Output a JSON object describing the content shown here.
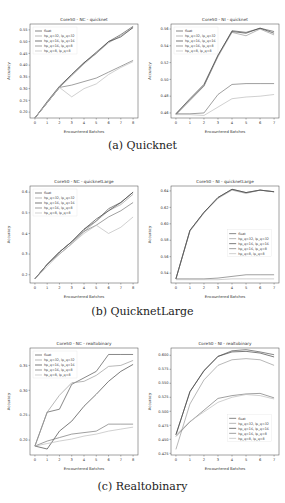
{
  "captions": {
    "a": "(a) Quicknet",
    "b": "(b) QuicknetLarge",
    "c": "(c) Realtobinary"
  },
  "legend_labels": [
    "float",
    "hp_q=32, lp_q=32",
    "hp_q=16, lp_q=16",
    "hp_q=16, lp_q=8",
    "hp_q=8, lp_q=8"
  ],
  "series_colors": [
    "#555555",
    "#9a9a9a",
    "#444444",
    "#777777",
    "#bbbbbb"
  ],
  "chart_data": [
    {
      "id": "nc_quicknet",
      "type": "line",
      "title": "Core50 - NC - quicknet",
      "xlabel": "Encountered Batches",
      "ylabel": "Accuracy",
      "x": [
        0,
        1,
        2,
        3,
        4,
        5,
        6,
        7,
        8
      ],
      "xticks": [
        "0",
        "1",
        "2",
        "3",
        "4",
        "5",
        "6",
        "7",
        "8"
      ],
      "yticks": [
        "0.20",
        "0.25",
        "0.30",
        "0.35",
        "0.40",
        "0.45",
        "0.50",
        "0.55"
      ],
      "ylim": [
        0.175,
        0.575
      ],
      "legend_position": "upper left",
      "series": [
        {
          "name": "float",
          "values": [
            0.175,
            0.24,
            0.305,
            0.36,
            0.41,
            0.45,
            0.5,
            0.53,
            0.565
          ]
        },
        {
          "name": "hp_q=32, lp_q=32",
          "values": [
            0.175,
            0.24,
            0.305,
            0.355,
            0.405,
            0.45,
            0.495,
            0.525,
            0.56
          ]
        },
        {
          "name": "hp_q=16, lp_q=16",
          "values": [
            0.175,
            0.245,
            0.31,
            0.36,
            0.41,
            0.455,
            0.5,
            0.52,
            0.56
          ]
        },
        {
          "name": "hp_q=16, lp_q=8",
          "values": [
            0.175,
            0.24,
            0.305,
            0.315,
            0.33,
            0.345,
            0.37,
            0.395,
            0.42
          ]
        },
        {
          "name": "hp_q=8, lp_q=8",
          "values": [
            0.175,
            0.24,
            0.305,
            0.265,
            0.3,
            0.32,
            0.36,
            0.39,
            0.415
          ]
        }
      ]
    },
    {
      "id": "ni_quicknet",
      "type": "line",
      "title": "Core50 - NI - quicknet",
      "xlabel": "Encountered Batches",
      "ylabel": "Accuracy",
      "x": [
        0,
        1,
        2,
        3,
        4,
        5,
        6,
        7
      ],
      "xticks": [
        "0",
        "1",
        "2",
        "3",
        "4",
        "5",
        "6",
        "7"
      ],
      "yticks": [
        "0.46",
        "0.48",
        "0.50",
        "0.52",
        "0.54",
        "0.56"
      ],
      "ylim": [
        0.454,
        0.566
      ],
      "legend_position": "upper left",
      "series": [
        {
          "name": "float",
          "values": [
            0.458,
            0.475,
            0.492,
            0.528,
            0.558,
            0.556,
            0.561,
            0.557
          ]
        },
        {
          "name": "hp_q=32, lp_q=32",
          "values": [
            0.459,
            0.476,
            0.493,
            0.527,
            0.556,
            0.552,
            0.56,
            0.553
          ]
        },
        {
          "name": "hp_q=16, lp_q=16",
          "values": [
            0.459,
            0.477,
            0.494,
            0.529,
            0.557,
            0.555,
            0.561,
            0.555
          ]
        },
        {
          "name": "hp_q=16, lp_q=8",
          "values": [
            0.459,
            0.459,
            0.46,
            0.482,
            0.494,
            0.495,
            0.495,
            0.495
          ]
        },
        {
          "name": "hp_q=8, lp_q=8",
          "values": [
            0.458,
            0.458,
            0.457,
            0.467,
            0.477,
            0.479,
            0.48,
            0.482
          ]
        }
      ]
    },
    {
      "id": "nc_quicknetlarge",
      "type": "line",
      "title": "Core50 - NC - quicknetLarge",
      "xlabel": "Encountered Batches",
      "ylabel": "Accuracy",
      "x": [
        0,
        1,
        2,
        3,
        4,
        5,
        6,
        7,
        8
      ],
      "xticks": [
        "0",
        "1",
        "2",
        "3",
        "4",
        "5",
        "6",
        "7",
        "8"
      ],
      "yticks": [
        "0.2",
        "0.3",
        "0.4",
        "0.5",
        "0.6"
      ],
      "ylim": [
        0.16,
        0.63
      ],
      "legend_position": "upper left",
      "series": [
        {
          "name": "float",
          "values": [
            0.18,
            0.25,
            0.31,
            0.36,
            0.42,
            0.46,
            0.52,
            0.55,
            0.6
          ]
        },
        {
          "name": "hp_q=32, lp_q=32",
          "values": [
            0.18,
            0.25,
            0.31,
            0.36,
            0.41,
            0.46,
            0.51,
            0.54,
            0.59
          ]
        },
        {
          "name": "hp_q=16, lp_q=16",
          "values": [
            0.18,
            0.25,
            0.31,
            0.36,
            0.42,
            0.47,
            0.51,
            0.55,
            0.6
          ]
        },
        {
          "name": "hp_q=16, lp_q=8",
          "values": [
            0.18,
            0.25,
            0.3,
            0.35,
            0.41,
            0.44,
            0.48,
            0.51,
            0.55
          ]
        },
        {
          "name": "hp_q=8, lp_q=8",
          "values": [
            0.18,
            0.24,
            0.3,
            0.35,
            0.4,
            0.44,
            0.4,
            0.43,
            0.48
          ]
        }
      ]
    },
    {
      "id": "ni_quicknetlarge",
      "type": "line",
      "title": "Core50 - NI - quicknetLarge",
      "xlabel": "Encountered Batches",
      "ylabel": "Accuracy",
      "x": [
        0,
        1,
        2,
        3,
        4,
        5,
        6,
        7
      ],
      "xticks": [
        "0",
        "1",
        "2",
        "3",
        "4",
        "5",
        "6",
        "7"
      ],
      "yticks": [
        "0.54",
        "0.56",
        "0.58",
        "0.60",
        "0.62",
        "0.64"
      ],
      "ylim": [
        0.528,
        0.646
      ],
      "legend_position": "center right",
      "series": [
        {
          "name": "float",
          "values": [
            0.533,
            0.592,
            0.614,
            0.632,
            0.642,
            0.638,
            0.641,
            0.639
          ]
        },
        {
          "name": "hp_q=32, lp_q=32",
          "values": [
            0.533,
            0.591,
            0.613,
            0.631,
            0.641,
            0.637,
            0.641,
            0.639
          ]
        },
        {
          "name": "hp_q=16, lp_q=16",
          "values": [
            0.533,
            0.592,
            0.614,
            0.632,
            0.642,
            0.638,
            0.641,
            0.639
          ]
        },
        {
          "name": "hp_q=16, lp_q=8",
          "values": [
            0.533,
            0.533,
            0.533,
            0.534,
            0.536,
            0.538,
            0.538,
            0.538
          ]
        },
        {
          "name": "hp_q=8, lp_q=8",
          "values": [
            0.532,
            0.532,
            0.532,
            0.532,
            0.533,
            0.533,
            0.533,
            0.533
          ]
        }
      ]
    },
    {
      "id": "nc_realtobinary",
      "type": "line",
      "title": "Core50 - NC - realtobinary",
      "xlabel": "Encountered Batches",
      "ylabel": "Accuracy",
      "x": [
        0,
        1,
        2,
        3,
        4,
        5,
        6,
        7,
        8
      ],
      "xticks": [
        "0",
        "1",
        "2",
        "3",
        "4",
        "5",
        "6",
        "7",
        "8"
      ],
      "yticks": [
        "0.20",
        "0.25",
        "0.30",
        "0.35"
      ],
      "ylim": [
        0.17,
        0.385
      ],
      "legend_position": "upper left",
      "series": [
        {
          "name": "float",
          "values": [
            0.188,
            0.256,
            0.262,
            0.312,
            0.325,
            0.338,
            0.372,
            0.372,
            0.372
          ]
        },
        {
          "name": "hp_q=32, lp_q=32",
          "values": [
            0.188,
            0.256,
            0.29,
            0.315,
            0.318,
            0.33,
            0.348,
            0.35,
            0.36
          ]
        },
        {
          "name": "hp_q=16, lp_q=16",
          "values": [
            0.188,
            0.182,
            0.218,
            0.238,
            0.268,
            0.292,
            0.318,
            0.338,
            0.352
          ]
        },
        {
          "name": "hp_q=16, lp_q=8",
          "values": [
            0.188,
            0.198,
            0.205,
            0.212,
            0.215,
            0.218,
            0.232,
            0.232,
            0.232
          ]
        },
        {
          "name": "hp_q=8, lp_q=8",
          "values": [
            0.188,
            0.193,
            0.198,
            0.202,
            0.208,
            0.212,
            0.218,
            0.222,
            0.226
          ]
        }
      ]
    },
    {
      "id": "ni_realtobinary",
      "type": "line",
      "title": "Core50 - NI - realtobinary",
      "xlabel": "Encountered Batches",
      "ylabel": "Accuracy",
      "x": [
        0,
        1,
        2,
        3,
        4,
        5,
        6,
        7
      ],
      "xticks": [
        "0",
        "1",
        "2",
        "3",
        "4",
        "5",
        "6",
        "7"
      ],
      "yticks": [
        "0.425",
        "0.450",
        "0.475",
        "0.500",
        "0.525",
        "0.550",
        "0.575",
        "0.600"
      ],
      "ylim": [
        0.422,
        0.613
      ],
      "legend_position": "lower right",
      "series": [
        {
          "name": "float",
          "values": [
            0.458,
            0.535,
            0.573,
            0.598,
            0.608,
            0.61,
            0.606,
            0.601
          ]
        },
        {
          "name": "hp_q=32, lp_q=32",
          "values": [
            0.432,
            0.513,
            0.556,
            0.582,
            0.592,
            0.594,
            0.592,
            0.582
          ]
        },
        {
          "name": "hp_q=16, lp_q=16",
          "values": [
            0.458,
            0.535,
            0.572,
            0.598,
            0.606,
            0.607,
            0.604,
            0.597
          ]
        },
        {
          "name": "hp_q=16, lp_q=8",
          "values": [
            0.455,
            0.481,
            0.502,
            0.523,
            0.528,
            0.531,
            0.532,
            0.524
          ]
        },
        {
          "name": "hp_q=8, lp_q=8",
          "values": [
            0.458,
            0.482,
            0.499,
            0.516,
            0.525,
            0.53,
            0.528,
            0.522
          ]
        }
      ]
    }
  ]
}
